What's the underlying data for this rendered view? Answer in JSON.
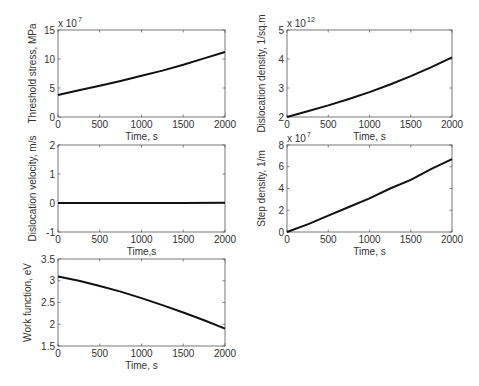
{
  "figure": {
    "width": 479,
    "height": 386,
    "line_color": "#111111",
    "axes_color": "#555555"
  },
  "chart_data": [
    {
      "type": "line",
      "position": "top-left",
      "title": "",
      "xlabel": "Time, s",
      "ylabel": "Threshold stress, MPa",
      "y_exponent": "x 10",
      "y_exponent_power": "7",
      "xlim": [
        0,
        2000
      ],
      "ylim": [
        0,
        15
      ],
      "xticks": [
        0,
        500,
        1000,
        1500,
        2000
      ],
      "yticks": [
        0,
        5,
        10,
        15
      ],
      "xtick_labels": [
        "0",
        "500",
        "1000",
        "1500",
        "2000"
      ],
      "ytick_labels": [
        "0",
        "5",
        "10",
        "15"
      ],
      "grid": false,
      "series": [
        {
          "name": "Threshold stress",
          "x": [
            0,
            250,
            500,
            750,
            1000,
            1250,
            1500,
            1750,
            2000
          ],
          "values": [
            3.8,
            4.6,
            5.4,
            6.2,
            7.1,
            8.0,
            9.0,
            10.1,
            11.2
          ]
        }
      ],
      "box": {
        "left": 58,
        "top": 30,
        "right": 225,
        "bottom": 117
      }
    },
    {
      "type": "line",
      "position": "top-right",
      "title": "",
      "xlabel": "Time, s",
      "ylabel": "Dislocation density, 1/sq.m",
      "y_exponent": "x 10",
      "y_exponent_power": "12",
      "xlim": [
        0,
        2000
      ],
      "ylim": [
        2,
        5
      ],
      "xticks": [
        0,
        500,
        1000,
        1500,
        2000
      ],
      "yticks": [
        2,
        3,
        4,
        5
      ],
      "xtick_labels": [
        "0",
        "500",
        "1000",
        "1500",
        "2000"
      ],
      "ytick_labels": [
        "2",
        "3",
        "4",
        "5"
      ],
      "grid": false,
      "series": [
        {
          "name": "Dislocation density",
          "x": [
            0,
            250,
            500,
            750,
            1000,
            1250,
            1500,
            1750,
            2000
          ],
          "values": [
            2.0,
            2.2,
            2.4,
            2.62,
            2.86,
            3.12,
            3.41,
            3.72,
            4.06
          ]
        }
      ],
      "box": {
        "left": 287,
        "top": 30,
        "right": 452,
        "bottom": 117
      }
    },
    {
      "type": "line",
      "position": "middle-left",
      "title": "",
      "xlabel": "Time,s",
      "ylabel": "Dislocation velocity, m/s",
      "y_exponent": "",
      "y_exponent_power": "",
      "xlim": [
        0,
        2000
      ],
      "ylim": [
        -1,
        2
      ],
      "xticks": [
        0,
        500,
        1000,
        1500,
        2000
      ],
      "yticks": [
        -1,
        0,
        1,
        2
      ],
      "xtick_labels": [
        "0",
        "500",
        "1000",
        "1500",
        "2000"
      ],
      "ytick_labels": [
        "-1",
        "0",
        "1",
        "2"
      ],
      "grid": false,
      "series": [
        {
          "name": "Dislocation velocity",
          "x": [
            0,
            500,
            1000,
            1500,
            2000
          ],
          "values": [
            0.0,
            0.0,
            0.0,
            0.0,
            0.01
          ]
        }
      ],
      "box": {
        "left": 58,
        "top": 145,
        "right": 225,
        "bottom": 232
      }
    },
    {
      "type": "line",
      "position": "middle-right",
      "title": "",
      "xlabel": "Time, s",
      "ylabel": "Step density, 1/m",
      "y_exponent": "x 10",
      "y_exponent_power": "7",
      "xlim": [
        0,
        2000
      ],
      "ylim": [
        0,
        8
      ],
      "xticks": [
        0,
        500,
        1000,
        1500,
        2000
      ],
      "yticks": [
        0,
        2,
        4,
        6,
        8
      ],
      "xtick_labels": [
        "0",
        "500",
        "1000",
        "1500",
        "2000"
      ],
      "ytick_labels": [
        "0",
        "2",
        "4",
        "6",
        "8"
      ],
      "grid": false,
      "series": [
        {
          "name": "Step density",
          "x": [
            0,
            250,
            500,
            750,
            1000,
            1250,
            1500,
            1750,
            2000
          ],
          "values": [
            0.0,
            0.7,
            1.5,
            2.3,
            3.1,
            4.0,
            4.8,
            5.8,
            6.7
          ]
        }
      ],
      "box": {
        "left": 287,
        "top": 145,
        "right": 452,
        "bottom": 232
      }
    },
    {
      "type": "line",
      "position": "bottom-left",
      "title": "",
      "xlabel": "Time, s",
      "ylabel": "Work function, eV",
      "y_exponent": "",
      "y_exponent_power": "",
      "xlim": [
        0,
        2000
      ],
      "ylim": [
        1.5,
        3.5
      ],
      "xticks": [
        0,
        500,
        1000,
        1500,
        2000
      ],
      "yticks": [
        1.5,
        2,
        2.5,
        3,
        3.5
      ],
      "xtick_labels": [
        "0",
        "500",
        "1000",
        "1500",
        "2000"
      ],
      "ytick_labels": [
        "1.5",
        "2",
        "2.5",
        "3",
        "3.5"
      ],
      "grid": false,
      "series": [
        {
          "name": "Work function",
          "x": [
            0,
            250,
            500,
            750,
            1000,
            1250,
            1500,
            1750,
            2000
          ],
          "values": [
            3.1,
            3.0,
            2.88,
            2.75,
            2.6,
            2.44,
            2.27,
            2.09,
            1.9
          ]
        }
      ],
      "box": {
        "left": 58,
        "top": 259,
        "right": 225,
        "bottom": 346
      }
    }
  ]
}
